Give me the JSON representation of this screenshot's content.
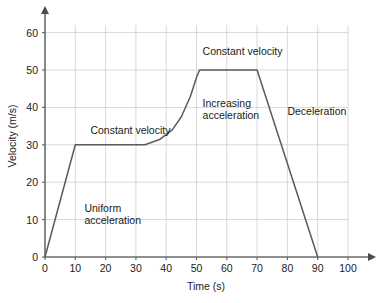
{
  "chart_data": {
    "type": "line",
    "title": "",
    "xlabel": "Time (s)",
    "ylabel": "Velocity (m/s)",
    "xlim": [
      0,
      100
    ],
    "ylim": [
      0,
      65
    ],
    "xticks": [
      0,
      10,
      20,
      30,
      40,
      50,
      60,
      70,
      80,
      90,
      100
    ],
    "yticks": [
      0,
      10,
      20,
      30,
      40,
      50,
      60
    ],
    "grid": true,
    "legend": "none",
    "series": [
      {
        "name": "velocity",
        "x": [
          0,
          10,
          33,
          38,
          42,
          45,
          48,
          50,
          51,
          70,
          90
        ],
        "y": [
          0,
          30,
          30,
          31.5,
          34,
          37.5,
          43,
          48,
          50,
          50,
          0
        ]
      }
    ],
    "annotations": [
      {
        "id": "uniform-acceleration",
        "lines": [
          "Uniform",
          "acceleration"
        ],
        "x": 13,
        "y": 12
      },
      {
        "id": "constant-velocity-1",
        "lines": [
          "Constant velocity"
        ],
        "x": 15,
        "y": 33
      },
      {
        "id": "increasing-acceleration",
        "lines": [
          "Increasing",
          "acceleration"
        ],
        "x": 52,
        "y": 40
      },
      {
        "id": "constant-velocity-2",
        "lines": [
          "Constant velocity"
        ],
        "x": 52,
        "y": 54
      },
      {
        "id": "deceleration",
        "lines": [
          "Deceleration"
        ],
        "x": 80,
        "y": 38
      }
    ],
    "colors": {
      "line": "#5a5a5a",
      "grid": "#c9c9c9",
      "axis": "#6b6b6b",
      "text": "#1a1a1a",
      "background": "#ffffff"
    }
  }
}
